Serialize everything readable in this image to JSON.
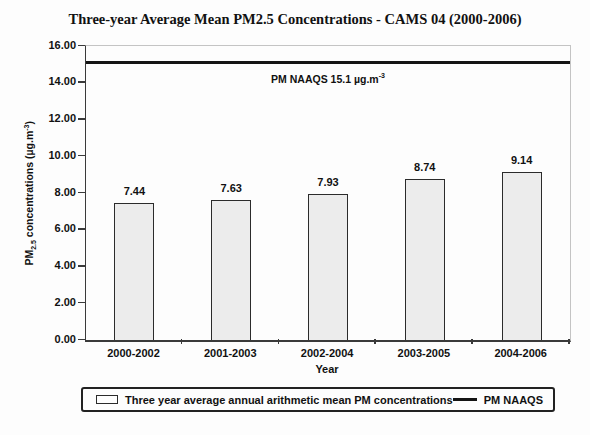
{
  "title": "Three-year Average Mean PM2.5 Concentrations - CAMS 04 (2000-2006)",
  "ylabel_parts": {
    "prefix": "PM",
    "sub": "2.5",
    "mid": " concentrations (µg.m",
    "sup": "-3",
    "suffix": ")"
  },
  "chart_data": {
    "type": "bar",
    "title": "Three-year Average Mean PM2.5 Concentrations - CAMS 04 (2000-2006)",
    "categories": [
      "2000-2002",
      "2001-2003",
      "2002-2004",
      "2003-2005",
      "2004-2006"
    ],
    "values": [
      7.44,
      7.63,
      7.93,
      8.74,
      9.14
    ],
    "value_labels": [
      "7.44",
      "7.63",
      "7.93",
      "8.74",
      "9.14"
    ],
    "xlabel": "Year",
    "ylabel": "PM2.5 concentrations (µg.m-3)",
    "ylim": [
      0,
      16
    ],
    "ytick_step": 2,
    "yticks": [
      "0.00",
      "2.00",
      "4.00",
      "6.00",
      "8.00",
      "10.00",
      "12.00",
      "14.00",
      "16.00"
    ],
    "grid": false,
    "reference_line": {
      "value": 15.1,
      "label_prefix": "PM NAAQS 15.1 µg.m",
      "label_sup": "-3",
      "color": "#141414"
    },
    "legend": {
      "position": "bottom",
      "items": [
        {
          "marker": "bar",
          "label": "Three year average annual arithmetic mean PM concentrations"
        },
        {
          "marker": "line",
          "label": "PM NAAQS"
        }
      ]
    },
    "colors": {
      "bar_fill": "#ececec",
      "bar_border": "#2b2b2b",
      "axis": "#3a3a3a",
      "frame": "#c4c4c4",
      "reference_line": "#141414"
    }
  }
}
